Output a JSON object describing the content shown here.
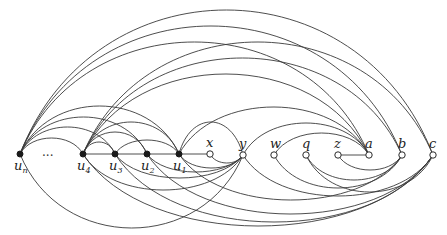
{
  "figure": {
    "ellipsis": "···",
    "nodes": [
      {
        "id": "un",
        "label": "u",
        "sub": "n",
        "x": 20,
        "y": 154,
        "type": "filled"
      },
      {
        "id": "u4",
        "label": "u",
        "sub": "4",
        "x": 83,
        "y": 154,
        "type": "filled"
      },
      {
        "id": "u3",
        "label": "u",
        "sub": "3",
        "x": 115,
        "y": 154,
        "type": "filled"
      },
      {
        "id": "u2",
        "label": "u",
        "sub": "2",
        "x": 147,
        "y": 154,
        "type": "filled"
      },
      {
        "id": "u1",
        "label": "u",
        "sub": "1",
        "x": 179,
        "y": 154,
        "type": "filled"
      },
      {
        "id": "x",
        "label": "x",
        "sub": "",
        "x": 210,
        "y": 154,
        "type": "hollow"
      },
      {
        "id": "y",
        "label": "y",
        "sub": "",
        "x": 243,
        "y": 155,
        "type": "hollow"
      },
      {
        "id": "w",
        "label": "w",
        "sub": "",
        "x": 274,
        "y": 155,
        "type": "hollow"
      },
      {
        "id": "q",
        "label": "q",
        "sub": "",
        "x": 306,
        "y": 155,
        "type": "hollow"
      },
      {
        "id": "z",
        "label": "z",
        "sub": "",
        "x": 338,
        "y": 155,
        "type": "hollow"
      },
      {
        "id": "a",
        "label": "a",
        "sub": "",
        "x": 369,
        "y": 155,
        "type": "hollow"
      },
      {
        "id": "b",
        "label": "b",
        "sub": "",
        "x": 402,
        "y": 155,
        "type": "hollow"
      },
      {
        "id": "c",
        "label": "c",
        "sub": "",
        "x": 433,
        "y": 155,
        "type": "hollow"
      }
    ],
    "edges": [
      {
        "from": "u4",
        "to": "x",
        "shape": "line"
      },
      {
        "from": "z",
        "to": "a",
        "shape": "line"
      },
      {
        "from": "un",
        "to": "c",
        "peak": 10
      },
      {
        "from": "un",
        "to": "b",
        "peak": 26
      },
      {
        "from": "un",
        "to": "a",
        "peak": 42
      },
      {
        "from": "u4",
        "to": "c",
        "peak": 42
      },
      {
        "from": "u4",
        "to": "b",
        "peak": 58
      },
      {
        "from": "u4",
        "to": "a",
        "peak": 74
      },
      {
        "from": "un",
        "to": "u1",
        "peak": 106
      },
      {
        "from": "un",
        "to": "u2",
        "peak": 117
      },
      {
        "from": "un",
        "to": "u3",
        "peak": 127
      },
      {
        "from": "un",
        "to": "u4",
        "peak": 138
      },
      {
        "from": "u4",
        "to": "u1",
        "peak": 122
      },
      {
        "from": "u4",
        "to": "u2",
        "peak": 132
      },
      {
        "from": "u4",
        "to": "u3",
        "peak": 142
      },
      {
        "from": "u3",
        "to": "u1",
        "peak": 140
      },
      {
        "from": "u1",
        "to": "a",
        "peak": 107
      },
      {
        "from": "y",
        "to": "a",
        "peak": 123
      },
      {
        "from": "w",
        "to": "a",
        "peak": 133
      },
      {
        "from": "u1",
        "to": "y",
        "peak": 122
      },
      {
        "from": "un",
        "to": "y",
        "peak": 228
      },
      {
        "from": "u4",
        "to": "y",
        "peak": 190
      },
      {
        "from": "u3",
        "to": "y",
        "peak": 178
      },
      {
        "from": "u2",
        "to": "y",
        "peak": 172
      },
      {
        "from": "u1",
        "to": "y",
        "peak": 168
      },
      {
        "from": "x",
        "to": "y",
        "peak": 163
      },
      {
        "from": "u4",
        "to": "c",
        "peak": 226
      },
      {
        "from": "u3",
        "to": "c",
        "peak": 222
      },
      {
        "from": "u2",
        "to": "c",
        "peak": 214
      },
      {
        "from": "u1",
        "to": "b",
        "peak": 200
      },
      {
        "from": "y",
        "to": "c",
        "peak": 196
      },
      {
        "from": "w",
        "to": "b",
        "peak": 188
      },
      {
        "from": "q",
        "to": "b",
        "peak": 180
      },
      {
        "from": "q",
        "to": "c",
        "peak": 192
      },
      {
        "from": "z",
        "to": "b",
        "peak": 170
      }
    ]
  }
}
